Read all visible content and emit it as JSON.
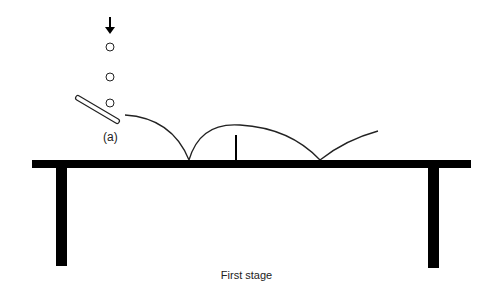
{
  "diagram": {
    "caption": "First stage",
    "paddle_label": "(a)",
    "elements": {
      "arrow": "down-arrow",
      "balls": 3,
      "table": "ping-pong table with net",
      "trajectory": "ball bouncing path"
    },
    "colors": {
      "ink": "#000000",
      "background": "#ffffff"
    }
  }
}
